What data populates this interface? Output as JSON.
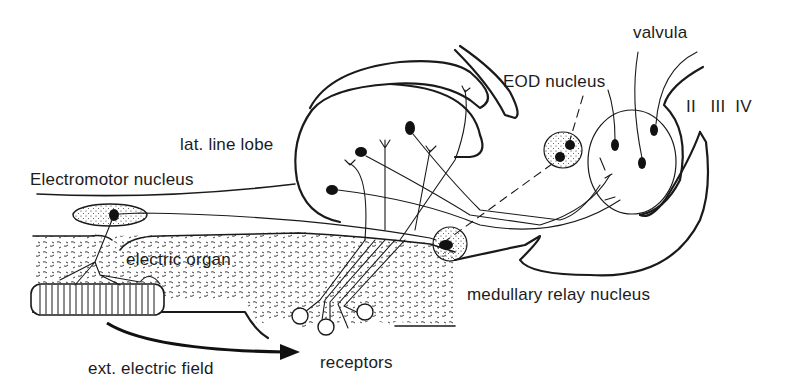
{
  "figure": {
    "colors": {
      "ink": "#1a1a1a",
      "background": "#ffffff",
      "stipple": "#2a2a2a"
    },
    "labels": {
      "valvula": "valvula",
      "eod_nucleus": "EOD nucleus",
      "cerebellar_lobes": "II   III  IV",
      "lat_line_lobe": "lat. line lobe",
      "electromotor_nucleus": "Electromotor nucleus",
      "electric_organ": "electric organ",
      "medullary_relay_nucleus": "medullary relay nucleus",
      "ext_electric_field": "ext. electric field",
      "receptors": "receptors"
    },
    "structures": [
      {
        "id": "lateral-line-lobe",
        "type": "lobe",
        "neuron_count": 4
      },
      {
        "id": "valvula-region",
        "type": "circle",
        "neuron_count": 3
      },
      {
        "id": "eod-nucleus",
        "type": "stippled-oval",
        "neuron_count": 2
      },
      {
        "id": "electromotor-nucleus",
        "type": "stippled-oval",
        "neuron_count": 1
      },
      {
        "id": "medullary-relay-nucleus",
        "type": "stippled-circle",
        "neuron_count": 1
      },
      {
        "id": "electric-organ",
        "type": "striped-bar"
      },
      {
        "id": "receptor-organs",
        "type": "cups",
        "count": 3
      },
      {
        "id": "external-field-arrow",
        "type": "arrow"
      }
    ]
  }
}
